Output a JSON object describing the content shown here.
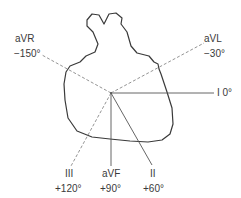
{
  "diagram": {
    "center": {
      "x": 111,
      "y": 93
    },
    "leads": [
      {
        "id": "I",
        "name": "I",
        "angle": "0°",
        "style": "solid"
      },
      {
        "id": "aVL",
        "name": "aVL",
        "angle": "−30°",
        "style": "dashed"
      },
      {
        "id": "aVR",
        "name": "aVR",
        "angle": "−150°",
        "style": "dashed"
      },
      {
        "id": "aVF",
        "name": "aVF",
        "angle": "+90°",
        "style": "solid"
      },
      {
        "id": "II",
        "name": "II",
        "angle": "+60°",
        "style": "solid"
      },
      {
        "id": "III",
        "name": "III",
        "angle": "+120°",
        "style": "dashed"
      }
    ],
    "labels": {
      "I": "I 0°",
      "aVL_name": "aVL",
      "aVL_angle": "−30°",
      "aVR_name": "aVR",
      "aVR_angle": "−150°",
      "aVF_name": "aVF",
      "aVF_angle": "+90°",
      "II_name": "II",
      "II_angle": "+60°",
      "III_name": "III",
      "III_angle": "+120°"
    },
    "colors": {
      "outline": "#3a3a3a",
      "solid_axis": "#555555",
      "dashed_axis": "#888888"
    }
  }
}
